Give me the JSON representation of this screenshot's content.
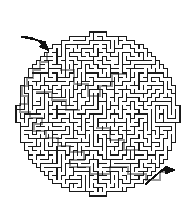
{
  "figure": {
    "kind": "circular-maze-puzzle",
    "width": 192,
    "height": 219,
    "background_color": "#ffffff",
    "title": "",
    "caption": ""
  },
  "maze": {
    "shape": "circle",
    "center_x": 98,
    "center_y": 114,
    "radius": 82,
    "cell_size": 4.1,
    "wall_color": "#1a1a1a",
    "wall_thickness": 1.15,
    "passage_color": "#ffffff",
    "solution_color": "#9a9a9a",
    "solution_thickness": 2.6,
    "grid_columns": 40,
    "grid_rows": 40,
    "seed": 20240517
  },
  "entry_marker": {
    "name": "entry-arrow",
    "label": "",
    "color": "#111111",
    "tip_x": 48,
    "tip_y": 50,
    "tail_x": 22,
    "tail_y": 37,
    "direction": "into-maze-from-upper-left"
  },
  "exit_marker": {
    "name": "exit-arrow",
    "label": "",
    "color": "#111111",
    "tip_x": 174,
    "tip_y": 170,
    "tail_x": 146,
    "tail_y": 184,
    "direction": "out-of-maze-to-lower-right"
  },
  "solution_path": {
    "visible": true,
    "points": [
      [
        47,
        52
      ],
      [
        47,
        62
      ],
      [
        40,
        62
      ],
      [
        40,
        70
      ],
      [
        33,
        70
      ],
      [
        33,
        78
      ],
      [
        27,
        78
      ],
      [
        27,
        86
      ],
      [
        22,
        86
      ],
      [
        22,
        96
      ],
      [
        28,
        96
      ],
      [
        28,
        104
      ],
      [
        20,
        104
      ],
      [
        20,
        112
      ],
      [
        30,
        112
      ],
      [
        30,
        118
      ],
      [
        42,
        118
      ],
      [
        42,
        124
      ],
      [
        34,
        124
      ],
      [
        34,
        131
      ],
      [
        46,
        131
      ],
      [
        46,
        138
      ],
      [
        58,
        138
      ],
      [
        58,
        146
      ],
      [
        70,
        146
      ],
      [
        70,
        152
      ],
      [
        84,
        152
      ],
      [
        84,
        160
      ],
      [
        70,
        160
      ],
      [
        70,
        167
      ],
      [
        90,
        167
      ],
      [
        90,
        174
      ],
      [
        110,
        174
      ],
      [
        110,
        167
      ],
      [
        128,
        167
      ],
      [
        128,
        174
      ],
      [
        146,
        174
      ],
      [
        146,
        180
      ],
      [
        160,
        180
      ],
      [
        160,
        172
      ],
      [
        170,
        172
      ]
    ],
    "branch_points": [
      [
        [
          60,
          70
        ],
        [
          74,
          70
        ],
        [
          74,
          84
        ],
        [
          88,
          84
        ],
        [
          88,
          96
        ],
        [
          100,
          96
        ],
        [
          100,
          86
        ],
        [
          112,
          86
        ],
        [
          112,
          74
        ],
        [
          126,
          74
        ]
      ],
      [
        [
          36,
          92
        ],
        [
          52,
          92
        ],
        [
          52,
          100
        ],
        [
          66,
          100
        ],
        [
          66,
          110
        ],
        [
          80,
          110
        ]
      ],
      [
        [
          96,
          128
        ],
        [
          110,
          128
        ],
        [
          110,
          140
        ],
        [
          124,
          140
        ],
        [
          124,
          150
        ],
        [
          138,
          150
        ]
      ]
    ]
  },
  "colors": {
    "wall": "#1a1a1a",
    "solution": "#9a9a9a",
    "background": "#ffffff",
    "arrow": "#111111"
  }
}
